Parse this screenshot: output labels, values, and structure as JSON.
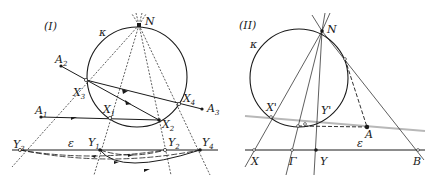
{
  "figure_I": {
    "title": "(I)",
    "circle_label": "κ",
    "line_label": "ε",
    "points": {
      "N": "N",
      "A1": "A",
      "A1_sub": "1",
      "A2": "A",
      "A2_sub": "2",
      "A3": "A",
      "A3_sub": "3",
      "X1": "X",
      "X1_sub": "1",
      "X2": "X",
      "X2_sub": "2",
      "X3": "X",
      "X3_sub": "3",
      "X4": "X",
      "X4_sub": "4",
      "Y1": "Y",
      "Y1_sub": "1",
      "Y2": "Y",
      "Y2_sub": "2",
      "Y3": "Y",
      "Y3_sub": "3",
      "Y4": "Y",
      "Y4_sub": "4"
    }
  },
  "figure_II": {
    "title": "(II)",
    "circle_label": "κ",
    "line_label": "ε",
    "points": {
      "N": "N",
      "A": "A",
      "X_prime": "X'",
      "Y_prime": "Y'",
      "X": "X",
      "Gamma": "Γ",
      "Y": "Y",
      "B": "B"
    }
  },
  "colors": {
    "ink": "#1a1a1a",
    "gray_line": "#b8b8b8"
  }
}
